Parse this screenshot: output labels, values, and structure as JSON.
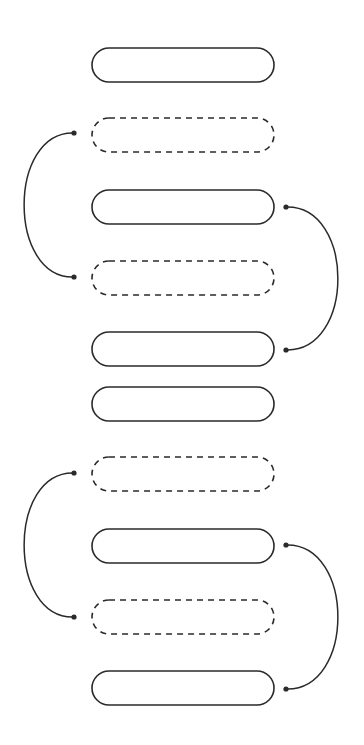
{
  "diagram": {
    "width": 364,
    "height": 745,
    "stroke_color": "#2a2a2a",
    "background": "#ffffff",
    "pill": {
      "x": 92,
      "width": 182,
      "height": 34,
      "radius": 17
    },
    "pills": [
      {
        "id": 1,
        "style": "solid",
        "y": 48
      },
      {
        "id": 2,
        "style": "dashed",
        "y": 118
      },
      {
        "id": 3,
        "style": "solid",
        "y": 190
      },
      {
        "id": 4,
        "style": "dashed",
        "y": 261
      },
      {
        "id": 5,
        "style": "solid",
        "y": 332
      },
      {
        "id": 6,
        "style": "solid",
        "y": 387
      },
      {
        "id": 7,
        "style": "dashed",
        "y": 457
      },
      {
        "id": 8,
        "style": "solid",
        "y": 529
      },
      {
        "id": 9,
        "style": "dashed",
        "y": 600
      },
      {
        "id": 10,
        "style": "solid",
        "y": 671
      }
    ],
    "arcs": [
      {
        "side": "left",
        "from": [
          74,
          133
        ],
        "to": [
          74,
          277
        ],
        "extreme_x": 24,
        "connects": [
          2,
          4
        ]
      },
      {
        "side": "right",
        "from": [
          286,
          207
        ],
        "to": [
          286,
          350
        ],
        "extreme_x": 338,
        "connects": [
          3,
          5
        ]
      },
      {
        "side": "left",
        "from": [
          74,
          473
        ],
        "to": [
          74,
          617
        ],
        "extreme_x": 24,
        "connects": [
          7,
          9
        ]
      },
      {
        "side": "right",
        "from": [
          286,
          545
        ],
        "to": [
          286,
          689
        ],
        "extreme_x": 338,
        "connects": [
          8,
          10
        ]
      }
    ]
  }
}
